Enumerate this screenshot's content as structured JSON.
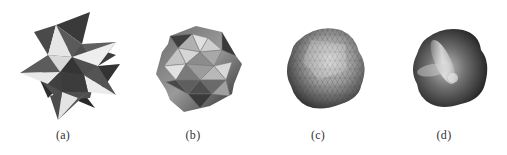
{
  "figure": {
    "panels": [
      {
        "id": "a",
        "label": "(a)",
        "description": "star polyhedron control mesh"
      },
      {
        "id": "b",
        "label": "(b)",
        "description": "first subdivision level, faceted triangles"
      },
      {
        "id": "c",
        "label": "(c)",
        "description": "fine triangulated mesh"
      },
      {
        "id": "d",
        "label": "(d)",
        "description": "smooth limit surface"
      }
    ]
  }
}
